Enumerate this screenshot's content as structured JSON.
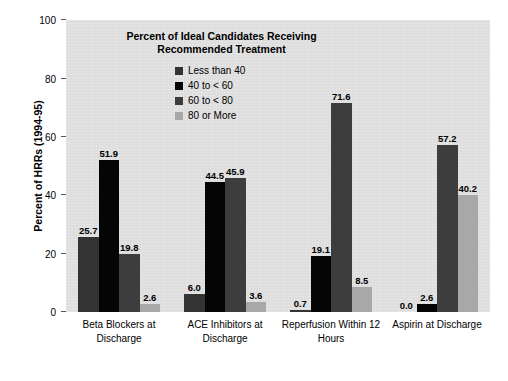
{
  "chart_data": {
    "type": "bar",
    "title": "Percent of Ideal Candidates Receiving Recommended Treatment",
    "title_line1": "Percent of Ideal Candidates",
    "title_line2": "Receiving Recommended Treatment",
    "xlabel": "",
    "ylabel": "Percent of HRRs (1994-95)",
    "ylim": [
      0,
      100
    ],
    "yticks": [
      0,
      20,
      40,
      60,
      80,
      100
    ],
    "ytick_labels": [
      "0",
      "20",
      "40",
      "60",
      "80",
      "100"
    ],
    "grid": false,
    "legend_position": "upper-center-inside",
    "categories": [
      "Beta Blockers at Discharge",
      "ACE Inhibitors at Discharge",
      "Reperfusion Within 12 Hours",
      "Aspirin at Discharge"
    ],
    "category_lines": [
      [
        "Beta Blockers at",
        "Discharge"
      ],
      [
        "ACE Inhibitors at",
        "Discharge"
      ],
      [
        "Reperfusion Within 12",
        "Hours"
      ],
      [
        "Aspirin at Discharge",
        ""
      ]
    ],
    "series": [
      {
        "name": "Less than 40",
        "color": "#333333",
        "values": [
          25.7,
          6.0,
          0.7,
          0.0
        ],
        "labels": [
          "25.7",
          "6.0",
          "0.7",
          "0.0"
        ]
      },
      {
        "name": "40 to < 60",
        "color": "#050505",
        "values": [
          51.9,
          44.5,
          19.1,
          2.6
        ],
        "labels": [
          "51.9",
          "44.5",
          "19.1",
          "2.6"
        ]
      },
      {
        "name": "60 to < 80",
        "color": "#3d3d3d",
        "values": [
          19.8,
          45.9,
          71.6,
          57.2
        ],
        "labels": [
          "19.8",
          "45.9",
          "71.6",
          "57.2"
        ]
      },
      {
        "name": "80 or More",
        "color": "#a8a8a8",
        "values": [
          2.6,
          3.6,
          8.5,
          40.2
        ],
        "labels": [
          "2.6",
          "3.6",
          "8.5",
          "40.2"
        ]
      }
    ],
    "plot_background": "#dddddd",
    "page_background": "#ffffff"
  }
}
